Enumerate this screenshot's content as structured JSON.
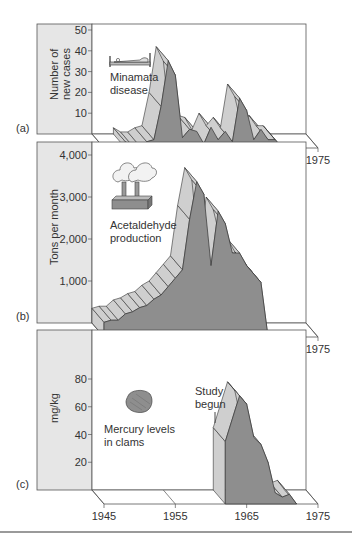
{
  "colors": {
    "label_panel": "#e6e6e6",
    "front_face": "#8e8e8e",
    "ribbon": "#cfcfcf",
    "edge": "#333333",
    "separator": "#9a9a9a"
  },
  "x_axis": {
    "ticks": [
      "1945",
      "1955",
      "1965",
      "1975"
    ],
    "range": [
      1945,
      1975
    ]
  },
  "chart_data": [
    {
      "type": "area",
      "panel": "(a)",
      "title": "Minamata disease",
      "ylabel": "Number of new cases",
      "ylabel_lines": [
        "Number of",
        "new cases"
      ],
      "xlabel": "",
      "yticks": [
        "10",
        "20",
        "30",
        "40",
        "50"
      ],
      "ylim": [
        0,
        50
      ],
      "x": [
        1948,
        1949,
        1950,
        1951,
        1952,
        1953,
        1954,
        1955,
        1956,
        1957,
        1958,
        1959,
        1960,
        1961,
        1962,
        1963,
        1964,
        1965,
        1966,
        1967,
        1968,
        1969,
        1970
      ],
      "values": [
        3,
        1,
        1,
        3,
        4,
        20,
        42,
        35,
        5,
        9,
        8,
        2,
        10,
        4,
        8,
        3,
        24,
        18,
        4,
        9,
        4,
        4,
        0
      ],
      "icon": "patient-in-bed"
    },
    {
      "type": "area",
      "panel": "(b)",
      "title": "Acetaldehyde production",
      "ylabel": "Tons per month",
      "xlabel": "",
      "yticks": [
        "1,000",
        "2,000",
        "3,000",
        "4,000"
      ],
      "ylim": [
        0,
        4000
      ],
      "x": [
        1945,
        1946,
        1947,
        1948,
        1949,
        1950,
        1951,
        1952,
        1953,
        1954,
        1955,
        1956,
        1957,
        1958,
        1959,
        1960,
        1961,
        1962,
        1963,
        1964,
        1965,
        1966,
        1967,
        1968
      ],
      "values": [
        350,
        400,
        400,
        550,
        600,
        700,
        750,
        900,
        1000,
        1200,
        1400,
        1600,
        2800,
        3700,
        3400,
        1700,
        3000,
        2700,
        2000,
        2000,
        1700,
        1500,
        1300,
        0
      ],
      "icon": "factory"
    },
    {
      "type": "area",
      "panel": "(c)",
      "title": "Mercury levels in clams",
      "ylabel": "mg/kg",
      "xlabel": "",
      "yticks": [
        "20",
        "40",
        "60",
        "80"
      ],
      "ylim": [
        0,
        100
      ],
      "x": [
        1962,
        1964,
        1965,
        1966,
        1967,
        1968,
        1969,
        1970,
        1971,
        1972
      ],
      "values": [
        45,
        78,
        72,
        48,
        43,
        30,
        8,
        5,
        7,
        0
      ],
      "annotation": "Study begun",
      "icon": "clam"
    }
  ],
  "panels": [
    {
      "tag": "(a)",
      "title_lines": [
        "Minamata",
        "disease"
      ],
      "ylabel_lines": [
        "Number of",
        "new cases"
      ]
    },
    {
      "tag": "(b)",
      "title_lines": [
        "Acetaldehyde",
        "production"
      ],
      "ylabel_lines": [
        "Tons per month"
      ]
    },
    {
      "tag": "(c)",
      "title_lines": [
        "Mercury levels",
        "in clams"
      ],
      "ylabel_lines": [
        "mg/kg"
      ],
      "annotation_lines": [
        "Study",
        "begun"
      ]
    }
  ]
}
